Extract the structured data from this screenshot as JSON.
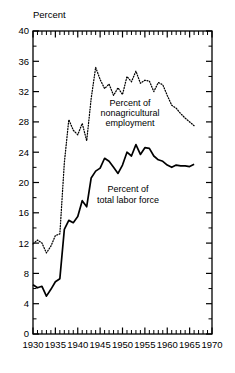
{
  "chart_data": {
    "type": "line",
    "title": "",
    "xlabel": "",
    "ylabel": "Percent",
    "xlim": [
      1930,
      1970
    ],
    "ylim": [
      0,
      40
    ],
    "ytick_step": 4,
    "yminor_step": 2,
    "xtick_step": 5,
    "xminor_step": 1,
    "grid": false,
    "legend_position": "inline-annotation",
    "xticks": [
      "1930",
      "1935",
      "1940",
      "1945",
      "1950",
      "1955",
      "1960",
      "1965",
      "1970"
    ],
    "yticks": [
      "0",
      "4",
      "8",
      "12",
      "16",
      "20",
      "24",
      "28",
      "32",
      "36",
      "40"
    ],
    "series": [
      {
        "name": "Percent of nonagricultural employment",
        "style": "dotted",
        "color": "#000000",
        "label_lines": [
          "Percent of",
          "nonagricultural",
          "employment"
        ],
        "x": [
          1930,
          1931,
          1932,
          1933,
          1934,
          1935,
          1936,
          1937,
          1938,
          1939,
          1940,
          1941,
          1942,
          1943,
          1944,
          1945,
          1946,
          1947,
          1948,
          1949,
          1950,
          1951,
          1952,
          1953,
          1954,
          1955,
          1956,
          1957,
          1958,
          1959,
          1960,
          1961,
          1962,
          1963,
          1964,
          1965,
          1966
        ],
        "values": [
          11.9,
          12.4,
          12.0,
          10.7,
          11.6,
          13.0,
          13.2,
          22.6,
          28.3,
          26.9,
          26.3,
          27.8,
          25.5,
          31.1,
          35.2,
          33.6,
          32.4,
          33.0,
          31.5,
          32.5,
          31.6,
          34.0,
          33.3,
          34.7,
          33.1,
          33.5,
          33.4,
          32.0,
          33.2,
          32.9,
          31.5,
          30.2,
          29.8,
          29.1,
          28.5,
          28.0,
          27.5
        ]
      },
      {
        "name": "Percent of total labor force",
        "style": "solid",
        "color": "#000000",
        "label_lines": [
          "Percent of",
          "total labor force"
        ],
        "x": [
          1930,
          1931,
          1932,
          1933,
          1934,
          1935,
          1936,
          1937,
          1938,
          1939,
          1940,
          1941,
          1942,
          1943,
          1944,
          1945,
          1946,
          1947,
          1948,
          1949,
          1950,
          1951,
          1952,
          1953,
          1954,
          1955,
          1956,
          1957,
          1958,
          1959,
          1960,
          1961,
          1962,
          1963,
          1964,
          1965,
          1966
        ],
        "values": [
          6.5,
          6.1,
          6.3,
          5.0,
          5.9,
          6.9,
          7.3,
          13.8,
          15.0,
          14.7,
          15.5,
          17.6,
          16.8,
          20.6,
          21.5,
          21.9,
          23.2,
          22.8,
          22.0,
          21.2,
          22.3,
          24.0,
          23.5,
          25.0,
          23.7,
          24.6,
          24.5,
          23.5,
          23.0,
          22.8,
          22.3,
          22.0,
          22.3,
          22.2,
          22.2,
          22.1,
          22.4
        ]
      }
    ]
  },
  "plot": {
    "left_px": 33,
    "right_px": 212,
    "top_px": 31,
    "bottom_px": 334
  }
}
